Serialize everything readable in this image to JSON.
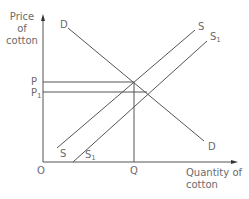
{
  "diagram": {
    "type": "supply-demand",
    "axes": {
      "y_label": "Price of cotton",
      "x_label": "Quantity of cotton",
      "origin_label": "O"
    },
    "price_labels": {
      "p": "P",
      "p1_base": "P",
      "p1_sub": "1"
    },
    "quantity_labels": {
      "q": "Q"
    },
    "curves": {
      "demand_top": "D",
      "demand_bottom": "D",
      "supply_top": "S",
      "supply_bottom": "S",
      "supply1_top_base": "S",
      "supply1_top_sub": "1",
      "supply1_bottom_base": "S",
      "supply1_bottom_sub": "1"
    },
    "colors": {
      "line": "#555555",
      "text": "#6b6b6b"
    }
  }
}
